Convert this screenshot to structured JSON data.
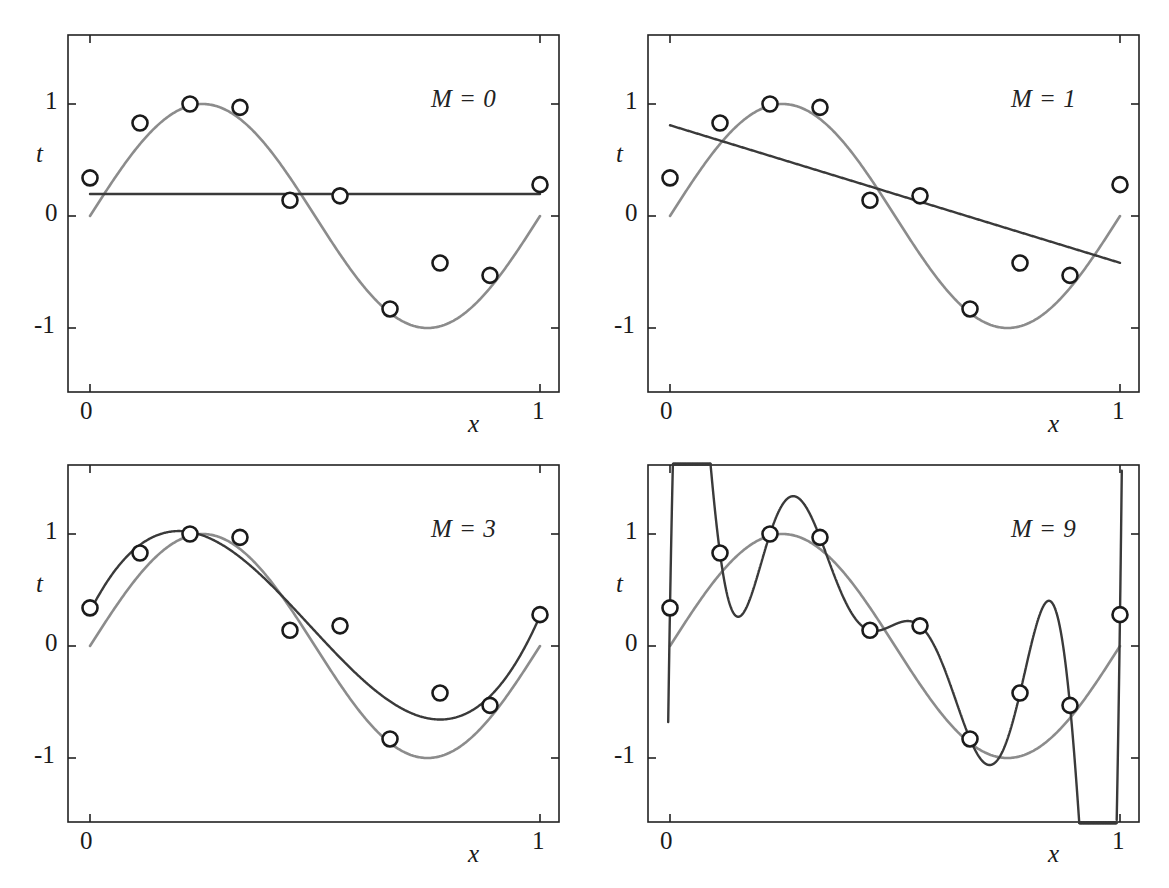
{
  "figure": {
    "width": 1169,
    "height": 888
  },
  "chart_data": {
    "type": "scatter",
    "xlabel": "x",
    "ylabel": "t",
    "xlim": [
      -0.05,
      1.08
    ],
    "ylim": [
      -1.5,
      1.5
    ],
    "xticks": [
      0,
      1
    ],
    "xticklabels": [
      "0",
      "1"
    ],
    "yticks": [
      -1,
      0,
      1
    ],
    "yticklabels": [
      "-1",
      "0",
      "1"
    ],
    "grid": false,
    "legend": "none",
    "data_points": {
      "name": "training data",
      "marker": "open-circle",
      "color": "#1a1a1a",
      "x": [
        0.0,
        0.1111,
        0.2222,
        0.3333,
        0.4444,
        0.5556,
        0.6667,
        0.7778,
        0.8889,
        1.0
      ],
      "t": [
        0.34,
        0.83,
        1.0,
        0.97,
        0.14,
        0.18,
        -0.83,
        -0.42,
        -0.53,
        0.28
      ]
    },
    "true_function": {
      "name": "sin(2*pi*x)",
      "color": "#8c8c8c",
      "linewidth": 2.6
    },
    "panels": [
      {
        "id": "panel-m0",
        "label": "M = 0",
        "M": 0,
        "fit_color": "#3a3a3a",
        "coefficients": [
          0.19
        ],
        "description": "constant fit"
      },
      {
        "id": "panel-m1",
        "label": "M = 1",
        "M": 1,
        "fit_color": "#3a3a3a",
        "coefficients": [
          0.82,
          -1.27
        ],
        "description": "linear fit"
      },
      {
        "id": "panel-m3",
        "label": "M = 3",
        "M": 3,
        "fit_color": "#3a3a3a",
        "coefficients": [
          0.31,
          7.99,
          -25.43,
          17.37
        ],
        "description": "cubic fit"
      },
      {
        "id": "panel-m9",
        "label": "M = 9",
        "M": 9,
        "fit_color": "#3a3a3a",
        "coefficients": [
          0.34,
          232.37,
          -5321.83,
          48568.31,
          -231639.3,
          640042.26,
          -1061800.52,
          1042400.18,
          -557682.99,
          125201.43
        ],
        "description": "ninth order fit, interpolates every data point with large oscillations"
      }
    ]
  },
  "panels": [
    {
      "label": "M = 0",
      "x_tick_0": "0",
      "x_tick_1": "1",
      "y_tick_neg1": "-1",
      "y_tick_0": "0",
      "y_tick_1": "1",
      "x_axis_label": "x",
      "y_axis_label": "t"
    },
    {
      "label": "M = 1",
      "x_tick_0": "0",
      "x_tick_1": "1",
      "y_tick_neg1": "-1",
      "y_tick_0": "0",
      "y_tick_1": "1",
      "x_axis_label": "x",
      "y_axis_label": "t"
    },
    {
      "label": "M = 3",
      "x_tick_0": "0",
      "x_tick_1": "1",
      "y_tick_neg1": "-1",
      "y_tick_0": "0",
      "y_tick_1": "1",
      "x_axis_label": "x",
      "y_axis_label": "t"
    },
    {
      "label": "M = 9",
      "x_tick_0": "0",
      "x_tick_1": "1",
      "y_tick_neg1": "-1",
      "y_tick_0": "0",
      "y_tick_1": "1",
      "x_axis_label": "x",
      "y_axis_label": "t"
    }
  ]
}
